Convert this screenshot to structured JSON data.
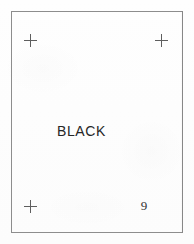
{
  "page": {
    "width": 194,
    "height": 244,
    "background_color": "#fdfdfd",
    "media": "scanned-color-chart-page"
  },
  "frame": {
    "name": "chart-frame",
    "border_color": "#8d8d8d",
    "border_width_px": 1
  },
  "registration_marks": [
    {
      "id": "top-left",
      "glyph": "+",
      "color": "#5e5e5e",
      "x": 30,
      "y": 40
    },
    {
      "id": "top-right",
      "glyph": "+",
      "color": "#5e5e5e",
      "x": 161,
      "y": 40
    },
    {
      "id": "bottom-left",
      "glyph": "+",
      "color": "#5e5e5e",
      "x": 30,
      "y": 206
    }
  ],
  "content": {
    "color_name": "BLACK",
    "color_name_color": "#262626",
    "page_number": "9",
    "page_number_color": "#333333"
  }
}
